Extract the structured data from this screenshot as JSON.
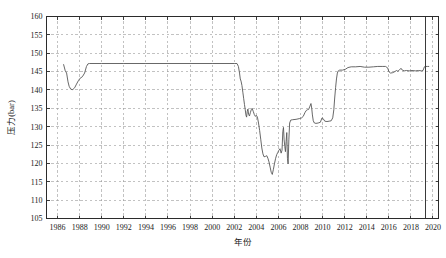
{
  "chart_data": {
    "type": "line",
    "title": "",
    "subtitle": "",
    "xlabel": "年份",
    "ylabel": "压力(bar)",
    "xlim": [
      1985.0,
      2020.5
    ],
    "ylim": [
      105,
      160
    ],
    "grid": true,
    "legend": null,
    "x_ticks": [
      1986,
      1988,
      1990,
      1992,
      1994,
      1996,
      1998,
      2000,
      2002,
      2004,
      2006,
      2008,
      2010,
      2012,
      2014,
      2016,
      2018,
      2020
    ],
    "x_tick_labels": [
      "1986",
      "1988",
      "1990",
      "1992",
      "1994",
      "1996",
      "1998",
      "2000",
      "2002",
      "2004",
      "2006",
      "2008",
      "2010",
      "2012",
      "2014",
      "2016",
      "2018",
      "2020"
    ],
    "y_ticks": [
      105,
      110,
      115,
      120,
      125,
      130,
      135,
      140,
      145,
      150,
      155,
      160
    ],
    "y_tick_labels": [
      "105",
      "110",
      "115",
      "120",
      "125",
      "130",
      "135",
      "140",
      "145",
      "150",
      "155",
      "160"
    ],
    "line_color": "#575757",
    "grid_color": "#9a9a9a",
    "frame_color": "#2b2b2b",
    "annotations": [
      {
        "name": "vertical-marker-line",
        "type": "vline",
        "x": 2019.3,
        "color": "#3a3a3a"
      }
    ],
    "series": [
      {
        "name": "压力",
        "units": "bar",
        "points": [
          [
            1986.55,
            146.9
          ],
          [
            1986.7,
            145.2
          ],
          [
            1986.82,
            144.6
          ],
          [
            1986.95,
            142.2
          ],
          [
            1987.05,
            141.0
          ],
          [
            1987.2,
            140.2
          ],
          [
            1987.38,
            140.1
          ],
          [
            1987.55,
            140.6
          ],
          [
            1987.72,
            141.6
          ],
          [
            1987.9,
            142.6
          ],
          [
            1988.05,
            143.2
          ],
          [
            1988.25,
            143.6
          ],
          [
            1988.45,
            144.6
          ],
          [
            1988.62,
            146.4
          ],
          [
            1988.75,
            147.1
          ],
          [
            1988.9,
            147.2
          ],
          [
            1990.0,
            147.2
          ],
          [
            1992.0,
            147.2
          ],
          [
            1994.0,
            147.2
          ],
          [
            1996.0,
            147.2
          ],
          [
            1998.0,
            147.2
          ],
          [
            2000.0,
            147.2
          ],
          [
            2002.0,
            147.2
          ],
          [
            2002.25,
            147.2
          ],
          [
            2002.38,
            146.4
          ],
          [
            2002.48,
            144.6
          ],
          [
            2002.55,
            143.0
          ],
          [
            2002.62,
            142.4
          ],
          [
            2002.7,
            141.2
          ],
          [
            2002.78,
            139.4
          ],
          [
            2002.86,
            137.6
          ],
          [
            2002.93,
            136.0
          ],
          [
            2003.0,
            134.6
          ],
          [
            2003.06,
            133.2
          ],
          [
            2003.12,
            132.6
          ],
          [
            2003.18,
            134.2
          ],
          [
            2003.24,
            134.8
          ],
          [
            2003.3,
            133.4
          ],
          [
            2003.38,
            132.9
          ],
          [
            2003.46,
            133.8
          ],
          [
            2003.54,
            134.6
          ],
          [
            2003.62,
            135.0
          ],
          [
            2003.72,
            134.2
          ],
          [
            2003.82,
            133.3
          ],
          [
            2003.92,
            132.8
          ],
          [
            2004.0,
            133.1
          ],
          [
            2004.1,
            132.6
          ],
          [
            2004.2,
            131.0
          ],
          [
            2004.3,
            129.0
          ],
          [
            2004.4,
            126.6
          ],
          [
            2004.5,
            124.2
          ],
          [
            2004.6,
            122.6
          ],
          [
            2004.7,
            121.8
          ],
          [
            2004.82,
            121.9
          ],
          [
            2004.95,
            122.1
          ],
          [
            2005.05,
            121.4
          ],
          [
            2005.15,
            120.4
          ],
          [
            2005.25,
            119.0
          ],
          [
            2005.35,
            117.6
          ],
          [
            2005.45,
            117.0
          ],
          [
            2005.55,
            118.4
          ],
          [
            2005.65,
            120.0
          ],
          [
            2005.75,
            121.4
          ],
          [
            2005.85,
            122.4
          ],
          [
            2005.95,
            123.0
          ],
          [
            2006.05,
            123.6
          ],
          [
            2006.15,
            124.0
          ],
          [
            2006.25,
            122.8
          ],
          [
            2006.33,
            123.6
          ],
          [
            2006.4,
            128.6
          ],
          [
            2006.46,
            129.8
          ],
          [
            2006.52,
            126.4
          ],
          [
            2006.58,
            124.6
          ],
          [
            2006.64,
            123.2
          ],
          [
            2006.7,
            126.0
          ],
          [
            2006.76,
            128.4
          ],
          [
            2006.82,
            121.4
          ],
          [
            2006.88,
            119.9
          ],
          [
            2006.95,
            126.6
          ],
          [
            2007.02,
            131.0
          ],
          [
            2007.12,
            131.8
          ],
          [
            2007.3,
            131.9
          ],
          [
            2007.6,
            132.0
          ],
          [
            2007.9,
            132.2
          ],
          [
            2008.1,
            132.4
          ],
          [
            2008.25,
            132.8
          ],
          [
            2008.4,
            133.8
          ],
          [
            2008.52,
            134.4
          ],
          [
            2008.62,
            134.6
          ],
          [
            2008.74,
            134.7
          ],
          [
            2008.86,
            135.6
          ],
          [
            2008.95,
            136.3
          ],
          [
            2009.02,
            135.0
          ],
          [
            2009.08,
            133.2
          ],
          [
            2009.16,
            131.6
          ],
          [
            2009.26,
            131.0
          ],
          [
            2009.4,
            130.9
          ],
          [
            2009.6,
            131.0
          ],
          [
            2009.8,
            131.2
          ],
          [
            2009.95,
            132.4
          ],
          [
            2010.05,
            132.2
          ],
          [
            2010.2,
            131.5
          ],
          [
            2010.4,
            131.4
          ],
          [
            2010.6,
            131.5
          ],
          [
            2010.78,
            131.6
          ],
          [
            2010.92,
            132.4
          ],
          [
            2011.02,
            134.6
          ],
          [
            2011.1,
            137.8
          ],
          [
            2011.18,
            140.6
          ],
          [
            2011.26,
            143.0
          ],
          [
            2011.34,
            144.6
          ],
          [
            2011.42,
            145.2
          ],
          [
            2011.55,
            145.4
          ],
          [
            2011.8,
            145.4
          ],
          [
            2012.05,
            145.6
          ],
          [
            2012.3,
            146.1
          ],
          [
            2012.6,
            146.3
          ],
          [
            2013.0,
            146.3
          ],
          [
            2013.4,
            146.4
          ],
          [
            2013.8,
            146.2
          ],
          [
            2014.2,
            146.2
          ],
          [
            2014.6,
            146.3
          ],
          [
            2015.0,
            146.4
          ],
          [
            2015.4,
            146.4
          ],
          [
            2015.7,
            146.4
          ],
          [
            2015.9,
            146.0
          ],
          [
            2016.0,
            145.0
          ],
          [
            2016.15,
            144.6
          ],
          [
            2016.35,
            144.7
          ],
          [
            2016.55,
            145.0
          ],
          [
            2016.7,
            145.3
          ],
          [
            2016.82,
            145.1
          ],
          [
            2016.95,
            145.4
          ],
          [
            2017.1,
            145.9
          ],
          [
            2017.22,
            145.4
          ],
          [
            2017.4,
            145.2
          ],
          [
            2017.6,
            145.3
          ],
          [
            2017.85,
            145.2
          ],
          [
            2018.1,
            145.3
          ],
          [
            2018.4,
            145.2
          ],
          [
            2018.7,
            145.3
          ],
          [
            2018.95,
            145.2
          ],
          [
            2019.1,
            145.3
          ],
          [
            2019.22,
            146.3
          ],
          [
            2019.32,
            146.4
          ],
          [
            2019.5,
            146.4
          ],
          [
            2019.62,
            146.4
          ]
        ]
      }
    ]
  }
}
